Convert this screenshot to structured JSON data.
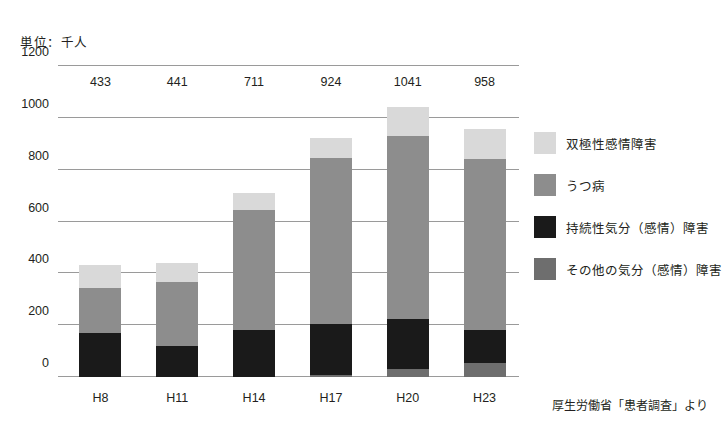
{
  "unit_caption": "単位：千人",
  "source_note": "厚生労働省「患者調査」より",
  "colors": {
    "bipolar": "#d9d9d9",
    "depression": "#8d8d8d",
    "persistent": "#1a1a1a",
    "other": "#6e6e6e",
    "gridline": "#9a9a9a",
    "text": "#231f20",
    "background": "#ffffff"
  },
  "legend": {
    "items": [
      {
        "label": "双極性感情障害",
        "key": "bipolar"
      },
      {
        "label": "うつ病",
        "key": "depression"
      },
      {
        "label": "持続性気分（感情）障害",
        "key": "persistent"
      },
      {
        "label": "その他の気分（感情）障害",
        "key": "other"
      }
    ]
  },
  "chart_data": {
    "type": "bar",
    "stacked": true,
    "title": "",
    "subtitle": "",
    "xlabel": "",
    "ylabel": "単位：千人",
    "ylim": [
      0,
      1200
    ],
    "yticks": [
      0,
      200,
      400,
      600,
      800,
      1000,
      1200
    ],
    "ytick_labels": [
      "0",
      "200",
      "400",
      "600",
      "800",
      "1000",
      "1200"
    ],
    "grid": true,
    "legend_position": "right",
    "categories": [
      "H8",
      "H11",
      "H14",
      "H17",
      "H20",
      "H23"
    ],
    "totals": [
      433,
      441,
      711,
      924,
      1041,
      958
    ],
    "total_labels": [
      "433",
      "441",
      "711",
      "924",
      "1041",
      "958"
    ],
    "series": [
      {
        "name": "その他の気分（感情）障害",
        "key": "other",
        "values": [
          0,
          0,
          0,
          8,
          30,
          55
        ]
      },
      {
        "name": "持続性気分（感情）障害",
        "key": "persistent",
        "values": [
          170,
          120,
          180,
          197,
          192,
          125
        ]
      },
      {
        "name": "うつ病",
        "key": "depression",
        "values": [
          175,
          245,
          465,
          640,
          708,
          660
        ]
      },
      {
        "name": "双極性感情障害",
        "key": "bipolar",
        "values": [
          88,
          76,
          66,
          79,
          111,
          118
        ]
      }
    ],
    "annotations": [
      "厚生労働省「患者調査」より"
    ]
  }
}
